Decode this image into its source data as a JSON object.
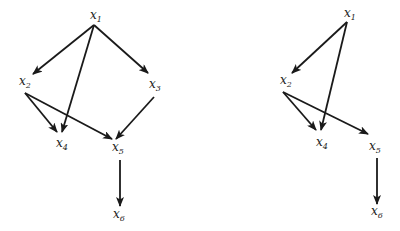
{
  "diagrams": [
    {
      "id": "left",
      "nodes": [
        {
          "id": "x1",
          "var": "x",
          "sub": "1",
          "x": 90,
          "y": 19
        },
        {
          "id": "x2",
          "var": "x",
          "sub": "2",
          "x": 19,
          "y": 85
        },
        {
          "id": "x3",
          "var": "x",
          "sub": "3",
          "x": 149,
          "y": 88
        },
        {
          "id": "x4",
          "var": "x",
          "sub": "4",
          "x": 56,
          "y": 147
        },
        {
          "id": "x5",
          "var": "x",
          "sub": "5",
          "x": 112,
          "y": 151
        },
        {
          "id": "x6",
          "var": "x",
          "sub": "6",
          "x": 113,
          "y": 218
        }
      ],
      "edges": [
        {
          "from": "x1",
          "to": "x2",
          "x1": 94,
          "y1": 25,
          "x2": 33,
          "y2": 74
        },
        {
          "from": "x1",
          "to": "x4",
          "x1": 94,
          "y1": 25,
          "x2": 62,
          "y2": 132
        },
        {
          "from": "x1",
          "to": "x3",
          "x1": 94,
          "y1": 25,
          "x2": 148,
          "y2": 73
        },
        {
          "from": "x2",
          "to": "x4",
          "x1": 25,
          "y1": 93,
          "x2": 57,
          "y2": 132
        },
        {
          "from": "x2",
          "to": "x5",
          "x1": 25,
          "y1": 93,
          "x2": 112,
          "y2": 139
        },
        {
          "from": "x3",
          "to": "x5",
          "x1": 154,
          "y1": 97,
          "x2": 116,
          "y2": 139
        },
        {
          "from": "x5",
          "to": "x6",
          "x1": 120,
          "y1": 160,
          "x2": 120,
          "y2": 206
        }
      ]
    },
    {
      "id": "right",
      "nodes": [
        {
          "id": "x1",
          "var": "x",
          "sub": "1",
          "x": 344,
          "y": 17
        },
        {
          "id": "x2",
          "var": "x",
          "sub": "2",
          "x": 280,
          "y": 84
        },
        {
          "id": "x4",
          "var": "x",
          "sub": "4",
          "x": 316,
          "y": 146
        },
        {
          "id": "x5",
          "var": "x",
          "sub": "5",
          "x": 369,
          "y": 150
        },
        {
          "id": "x6",
          "var": "x",
          "sub": "6",
          "x": 371,
          "y": 215
        }
      ],
      "edges": [
        {
          "from": "x1",
          "to": "x2",
          "x1": 347,
          "y1": 22,
          "x2": 292,
          "y2": 73
        },
        {
          "from": "x1",
          "to": "x4",
          "x1": 347,
          "y1": 22,
          "x2": 321,
          "y2": 130
        },
        {
          "from": "x2",
          "to": "x4",
          "x1": 283,
          "y1": 92,
          "x2": 316,
          "y2": 130
        },
        {
          "from": "x2",
          "to": "x5",
          "x1": 283,
          "y1": 92,
          "x2": 368,
          "y2": 134
        },
        {
          "from": "x5",
          "to": "x6",
          "x1": 377,
          "y1": 158,
          "x2": 377,
          "y2": 204
        }
      ]
    }
  ]
}
